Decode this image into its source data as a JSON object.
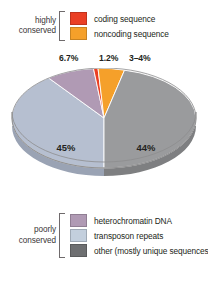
{
  "legend_top": {
    "bracket_label_line1": "highly",
    "bracket_label_line2": "conserved",
    "items": [
      {
        "label": "coding sequence",
        "color": "#ea3f24"
      },
      {
        "label": "noncoding sequence",
        "color": "#f5a02a"
      }
    ]
  },
  "legend_bottom": {
    "bracket_label_line1": "poorly",
    "bracket_label_line2": "conserved",
    "items": [
      {
        "label": "heterochromatin DNA",
        "color": "#b09ab4"
      },
      {
        "label": "transposon repeats",
        "color": "#c3cfdd"
      },
      {
        "label": "other (mostly unique sequences)",
        "color": "#6e6f71"
      }
    ]
  },
  "callouts": [
    {
      "text": "6.7%"
    },
    {
      "text": "1.2%"
    },
    {
      "text": "3–4%"
    }
  ],
  "chart_data": {
    "type": "pie",
    "title": "",
    "three_d": true,
    "legend_position": "top-and-bottom",
    "categories": [
      "transposon repeats",
      "heterochromatin DNA",
      "coding sequence",
      "noncoding sequence",
      "other (mostly unique sequences)"
    ],
    "values": [
      45,
      6.7,
      1.2,
      3.5,
      44
    ],
    "value_labels": [
      "45%",
      "6.7%",
      "1.2%",
      "3–4%",
      "44%"
    ],
    "colors": [
      "#b6bfd0",
      "#b09ab4",
      "#ea3f24",
      "#f5a02a",
      "#9a9b9d"
    ],
    "side_colors": [
      "#9aa3b4",
      "#90809a",
      "#c33418",
      "#cf871f",
      "#7e7f81"
    ],
    "inner_labels": [
      {
        "text": "45%",
        "x": 66,
        "y": 83
      },
      {
        "text": "44%",
        "x": 146,
        "y": 83
      }
    ],
    "rim_color": "#c9c8c6",
    "outline_color": "#7f7f80"
  }
}
